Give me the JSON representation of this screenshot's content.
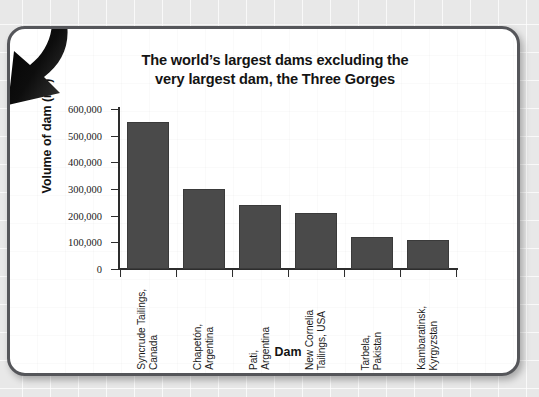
{
  "slide": {
    "title_line1": "The world’s largest dams excluding the",
    "title_line2": "very largest dam, the Three Gorges"
  },
  "decoration": {
    "arrow_name": "curved-arrow-down-left-icon"
  },
  "colors": {
    "bar_fill": "#4a4a4a",
    "bar_stroke": "#3a3a3a",
    "axis": "#2d2d2d",
    "frame_border": "#55565a",
    "slide_background": "#ffffff",
    "page_background": "#e8e8e8",
    "text": "#141414"
  },
  "chart_data": {
    "type": "bar",
    "title": "The world’s largest dams excluding the very largest dam, the Three Gorges",
    "xlabel": "Dam",
    "ylabel": "Volume of dam (m³)",
    "ylim": [
      0,
      600000
    ],
    "ytick_step": 100000,
    "ytick_labels": [
      "600,000",
      "500,000",
      "400,000",
      "300,000",
      "200,000",
      "100,000",
      "0"
    ],
    "ytick_values": [
      600000,
      500000,
      400000,
      300000,
      200000,
      100000,
      0
    ],
    "grid": false,
    "legend": false,
    "categories": [
      "Syncrude Tailings, Canada",
      "Chapetón, Argentina",
      "Pati, Argentina",
      "New Cornelia Tailings, USA",
      "Tarbela, Pakistan",
      "Kambaratinsk, Kyrgyzstan"
    ],
    "category_lines": [
      [
        "Syncrude Tailings,",
        "Canada"
      ],
      [
        "Chapetón,",
        "Argentina"
      ],
      [
        "Pati,",
        "Argentina"
      ],
      [
        "New Cornelia",
        "Tailings, USA"
      ],
      [
        "Tarbela,",
        "Pakistan"
      ],
      [
        "Kambaratinsk,",
        "Kyrgyzstan"
      ]
    ],
    "values": [
      550000,
      300000,
      240000,
      210000,
      120000,
      110000
    ]
  }
}
